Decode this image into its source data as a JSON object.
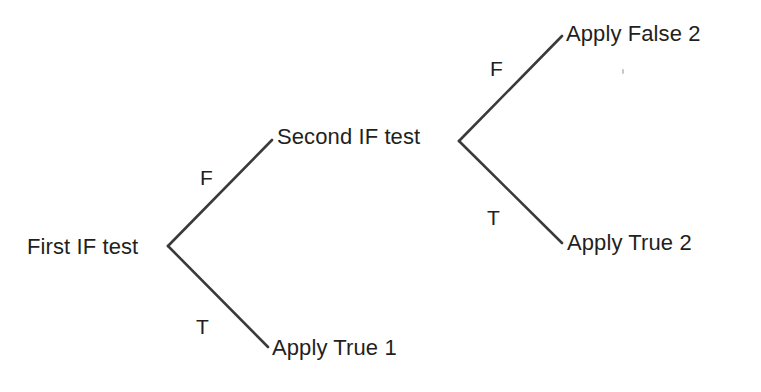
{
  "diagram": {
    "type": "decision-tree",
    "line_color": "#3a3a3a",
    "text_color": "#231f20",
    "background_color": "#ffffff",
    "nodes": [
      {
        "id": "first-if-test",
        "label": "First IF test",
        "x": 27,
        "y": 247,
        "anchor": "left"
      },
      {
        "id": "second-if-test",
        "label": "Second IF test",
        "x": 277,
        "y": 137,
        "anchor": "left"
      },
      {
        "id": "apply-false-2",
        "label": "Apply False 2",
        "x": 566,
        "y": 34,
        "anchor": "left"
      },
      {
        "id": "apply-true-2",
        "label": "Apply True 2",
        "x": 567,
        "y": 243,
        "anchor": "left"
      },
      {
        "id": "apply-true-1",
        "label": "Apply True 1",
        "x": 272,
        "y": 348,
        "anchor": "left"
      }
    ],
    "edges": [
      {
        "id": "first-false",
        "label": "F",
        "from": "first-if-test",
        "to": "second-if-test",
        "x1": 168,
        "y1": 246,
        "x2": 272,
        "y2": 140,
        "label_x": 200,
        "label_y": 167
      },
      {
        "id": "first-true",
        "label": "T",
        "from": "first-if-test",
        "to": "apply-true-1",
        "x1": 168,
        "y1": 246,
        "x2": 268,
        "y2": 347,
        "label_x": 196,
        "label_y": 316
      },
      {
        "id": "second-false",
        "label": "F",
        "from": "second-if-test",
        "to": "apply-false-2",
        "x1": 459,
        "y1": 141,
        "x2": 562,
        "y2": 36,
        "label_x": 490,
        "label_y": 58
      },
      {
        "id": "second-true",
        "label": "T",
        "from": "second-if-test",
        "to": "apply-true-2",
        "x1": 459,
        "y1": 141,
        "x2": 562,
        "y2": 243,
        "label_x": 487,
        "label_y": 207
      }
    ],
    "artifacts": [
      {
        "id": "scan-speck",
        "x": 622,
        "y": 69
      }
    ]
  }
}
